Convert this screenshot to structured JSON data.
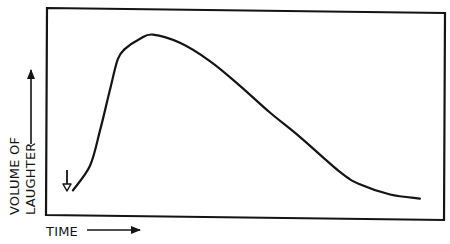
{
  "chart_data": {
    "type": "line",
    "title": "",
    "xlabel": "TIME",
    "ylabel": "VOLUME OF LAUGHTER",
    "ylabel_lines": [
      "VOLUME OF",
      "LAUGHTER"
    ],
    "grid": false,
    "legend": null,
    "ticks": false,
    "xlim": [
      0,
      100
    ],
    "ylim": [
      0,
      100
    ],
    "annotations": [
      {
        "type": "down-arrow",
        "label": "",
        "x": 5,
        "y": 12,
        "meaning": "onset marker at start of curve"
      }
    ],
    "series": [
      {
        "name": "laughter",
        "x": [
          6.5,
          10.8,
          13.3,
          15.8,
          17.8,
          19.6,
          23.4,
          26.6,
          33.4,
          41,
          48.5,
          56,
          63.6,
          73.6,
          78.6,
          86.2,
          93.7
        ],
        "values": [
          12,
          24,
          41,
          61,
          76,
          81,
          86,
          88,
          84,
          75,
          63,
          50,
          38,
          21,
          15,
          10,
          8
        ]
      }
    ]
  },
  "labels": {
    "x_axis": "TIME",
    "y_axis_line1": "VOLUME OF",
    "y_axis_line2": "LAUGHTER"
  },
  "colors": {
    "ink": "#141414",
    "background": "#ffffff"
  }
}
